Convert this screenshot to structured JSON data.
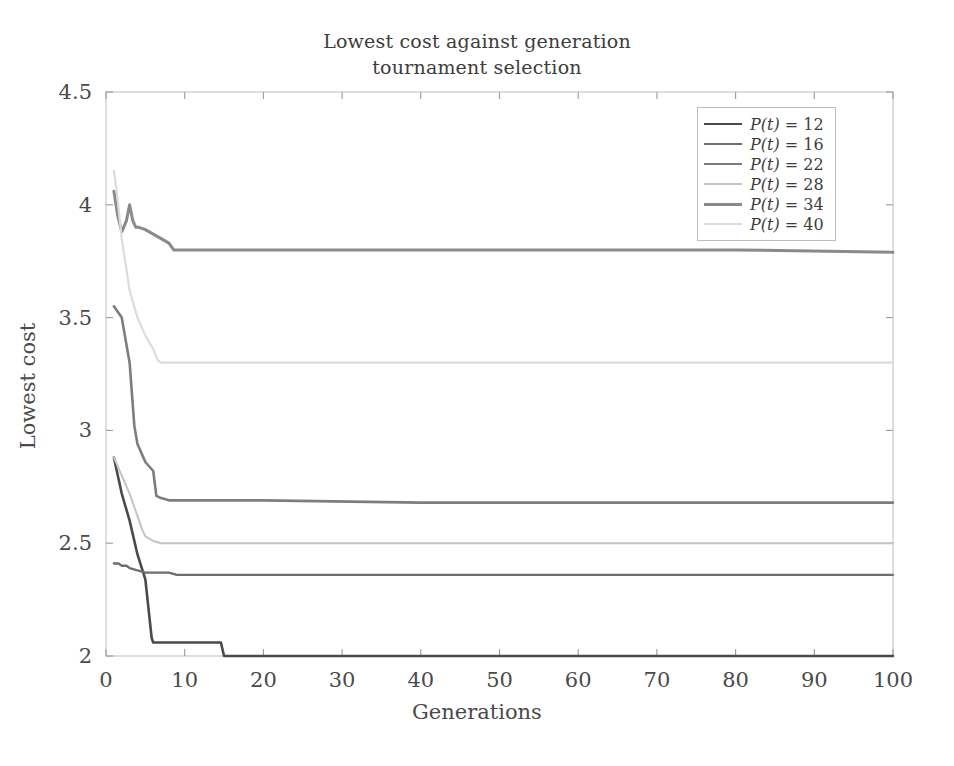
{
  "chart_data": {
    "type": "line",
    "title": "Lowest cost against generation\ntournament selection",
    "xlabel": "Generations",
    "ylabel": "Lowest cost",
    "xlim": [
      0,
      100
    ],
    "ylim": [
      2,
      4.5
    ],
    "xticks": [
      0,
      10,
      20,
      30,
      40,
      50,
      60,
      70,
      80,
      90,
      100
    ],
    "yticks": [
      2,
      2.5,
      3,
      3.5,
      4,
      4.5
    ],
    "xtick_labels": [
      "0",
      "10",
      "20",
      "30",
      "40",
      "50",
      "60",
      "70",
      "80",
      "90",
      "100"
    ],
    "ytick_labels": [
      "2",
      "2.5",
      "3",
      "3.5",
      "4",
      "4.5"
    ],
    "grid": false,
    "legend_position": "upper right",
    "series": [
      {
        "name": "P(t) = 12",
        "label_prefix": "P(t)",
        "label_value": "12",
        "color": "#4a4a4a",
        "width": 2.6,
        "x": [
          1,
          2,
          3,
          4,
          5,
          5.8,
          6,
          7,
          9,
          12,
          14.6,
          15,
          18,
          25,
          40,
          60,
          80,
          100
        ],
        "y": [
          2.88,
          2.72,
          2.6,
          2.45,
          2.34,
          2.08,
          2.06,
          2.06,
          2.06,
          2.06,
          2.06,
          2.0,
          2.0,
          2.0,
          2.0,
          2.0,
          2.0,
          2.0
        ]
      },
      {
        "name": "P(t) = 16",
        "label_prefix": "P(t)",
        "label_value": "16",
        "color": "#6e6e6e",
        "width": 2.3,
        "x": [
          1,
          1.6,
          2,
          2.6,
          3,
          4,
          5,
          6,
          7,
          8,
          9,
          20,
          40,
          60,
          80,
          100
        ],
        "y": [
          2.41,
          2.41,
          2.4,
          2.4,
          2.39,
          2.38,
          2.37,
          2.37,
          2.37,
          2.37,
          2.36,
          2.36,
          2.36,
          2.36,
          2.36,
          2.36
        ]
      },
      {
        "name": "P(t) = 22",
        "label_prefix": "P(t)",
        "label_value": "22",
        "color": "#7d7d7d",
        "width": 2.6,
        "x": [
          1,
          2,
          3,
          3.6,
          4,
          5,
          6,
          6.4,
          7,
          8,
          9,
          10,
          20,
          40,
          60,
          80,
          100
        ],
        "y": [
          3.55,
          3.5,
          3.3,
          3.02,
          2.94,
          2.86,
          2.82,
          2.71,
          2.7,
          2.69,
          2.69,
          2.69,
          2.69,
          2.68,
          2.68,
          2.68,
          2.68
        ]
      },
      {
        "name": "P(t) = 28",
        "label_prefix": "P(t)",
        "label_value": "28",
        "color": "#c4c4c4",
        "width": 2.0,
        "x": [
          1,
          2,
          3,
          4,
          4.6,
          5,
          6,
          7,
          8,
          10,
          20,
          40,
          60,
          80,
          100
        ],
        "y": [
          2.88,
          2.8,
          2.72,
          2.62,
          2.56,
          2.53,
          2.51,
          2.5,
          2.5,
          2.5,
          2.5,
          2.5,
          2.5,
          2.5,
          2.5
        ]
      },
      {
        "name": "P(t) = 34",
        "label_prefix": "P(t)",
        "label_value": "34",
        "color": "#8a8a8a",
        "width": 3.0,
        "x": [
          1,
          1.5,
          2,
          2.6,
          3,
          3.4,
          3.8,
          4.2,
          5,
          6,
          7,
          8,
          8.6,
          9,
          12,
          20,
          40,
          60,
          80,
          100
        ],
        "y": [
          4.06,
          3.95,
          3.88,
          3.93,
          4.0,
          3.93,
          3.9,
          3.9,
          3.89,
          3.87,
          3.85,
          3.83,
          3.8,
          3.8,
          3.8,
          3.8,
          3.8,
          3.8,
          3.8,
          3.79
        ]
      },
      {
        "name": "P(t) = 40",
        "label_prefix": "P(t)",
        "label_value": "40",
        "color": "#dcdcdc",
        "width": 2.2,
        "x": [
          1,
          1.4,
          2,
          3,
          4,
          5,
          6,
          6.6,
          7,
          8,
          9,
          10,
          20,
          40,
          60,
          80,
          100
        ],
        "y": [
          4.15,
          4.05,
          3.85,
          3.62,
          3.5,
          3.42,
          3.36,
          3.31,
          3.3,
          3.3,
          3.3,
          3.3,
          3.3,
          3.3,
          3.3,
          3.3,
          3.3
        ]
      }
    ]
  },
  "axes": {
    "frame_color": "#c9c9c9",
    "tick_color": "#9a9a9a",
    "background": "#ffffff"
  }
}
